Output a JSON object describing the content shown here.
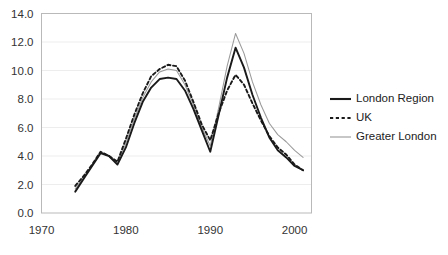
{
  "chart_data": {
    "type": "line",
    "title": "",
    "xlabel": "",
    "ylabel": "",
    "xlim": [
      1970,
      2002
    ],
    "ylim": [
      0.0,
      14.0
    ],
    "grid": true,
    "legend_position": "right",
    "x_ticks": [
      "1970",
      "1980",
      "1990",
      "2000"
    ],
    "x_tick_values": [
      1970,
      1980,
      1990,
      2000
    ],
    "y_ticks": [
      "0.0",
      "2.0",
      "4.0",
      "6.0",
      "8.0",
      "10.0",
      "12.0",
      "14.0"
    ],
    "y_tick_values": [
      0.0,
      2.0,
      4.0,
      6.0,
      8.0,
      10.0,
      12.0,
      14.0
    ],
    "x": [
      1974,
      1975,
      1976,
      1977,
      1978,
      1979,
      1980,
      1981,
      1982,
      1983,
      1984,
      1985,
      1986,
      1987,
      1988,
      1989,
      1990,
      1991,
      1992,
      1993,
      1994,
      1995,
      1996,
      1997,
      1998,
      1999,
      2000,
      2001
    ],
    "series": [
      {
        "name": "London Region",
        "style": "solid",
        "color": "#1a1a1a",
        "values": [
          1.5,
          2.4,
          3.3,
          4.2,
          4.0,
          3.4,
          4.6,
          6.3,
          7.8,
          8.8,
          9.4,
          9.5,
          9.4,
          8.6,
          7.3,
          5.8,
          4.3,
          6.9,
          9.5,
          11.6,
          10.2,
          8.3,
          6.7,
          5.3,
          4.4,
          3.9,
          3.3,
          3.0
        ]
      },
      {
        "name": "UK",
        "style": "dashed",
        "color": "#1a1a1a",
        "values": [
          1.9,
          2.6,
          3.4,
          4.3,
          4.0,
          3.6,
          5.2,
          6.9,
          8.4,
          9.6,
          10.1,
          10.4,
          10.3,
          9.3,
          7.8,
          6.2,
          5.1,
          7.0,
          8.6,
          9.7,
          9.0,
          7.7,
          6.5,
          5.4,
          4.6,
          4.1,
          3.4,
          3.0
        ]
      },
      {
        "name": "Greater London",
        "style": "thin",
        "color": "#9a9a9a",
        "values": [
          1.7,
          2.5,
          3.4,
          4.3,
          4.0,
          3.5,
          4.9,
          6.6,
          8.1,
          9.2,
          9.9,
          10.1,
          10.0,
          9.0,
          7.6,
          6.0,
          4.7,
          7.4,
          10.3,
          12.6,
          11.2,
          9.2,
          7.6,
          6.3,
          5.5,
          5.0,
          4.4,
          3.9
        ]
      }
    ],
    "legend": [
      {
        "label": "London Region",
        "style": "solid"
      },
      {
        "label": "UK",
        "style": "dashed"
      },
      {
        "label": "Greater London",
        "style": "thin"
      }
    ]
  }
}
